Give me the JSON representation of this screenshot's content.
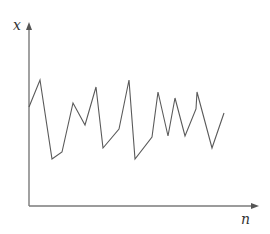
{
  "chart_data": {
    "type": "line",
    "title": "",
    "xlabel": "n",
    "ylabel": "x",
    "grid": false,
    "legend": null,
    "axes_style": "arrows, no ticks",
    "series": [
      {
        "name": "x(n)",
        "color": "#5a5a5a",
        "points_px": [
          [
            29,
            107
          ],
          [
            40,
            80
          ],
          [
            52,
            159
          ],
          [
            62,
            152
          ],
          [
            73,
            103
          ],
          [
            85,
            125
          ],
          [
            96,
            87
          ],
          [
            103,
            148
          ],
          [
            119,
            129
          ],
          [
            129,
            80
          ],
          [
            135,
            159
          ],
          [
            152,
            137
          ],
          [
            158,
            92
          ],
          [
            168,
            136
          ],
          [
            175,
            98
          ],
          [
            185,
            136
          ],
          [
            196,
            109
          ],
          [
            197,
            92
          ],
          [
            212,
            148
          ],
          [
            224,
            113
          ]
        ],
        "values": [
          0.54,
          0.69,
          0.26,
          0.3,
          0.56,
          0.45,
          0.65,
          0.32,
          0.42,
          0.69,
          0.26,
          0.38,
          0.62,
          0.38,
          0.59,
          0.38,
          0.53,
          0.62,
          0.32,
          0.51
        ]
      }
    ],
    "x_pixel_range": [
      29,
      257
    ],
    "y_pixel_range": [
      206,
      24
    ]
  },
  "labels": {
    "y_axis": "x",
    "x_axis": "n"
  },
  "colors": {
    "axis": "#7a7a7a",
    "line": "#5a5a5a",
    "background": "#ffffff"
  }
}
